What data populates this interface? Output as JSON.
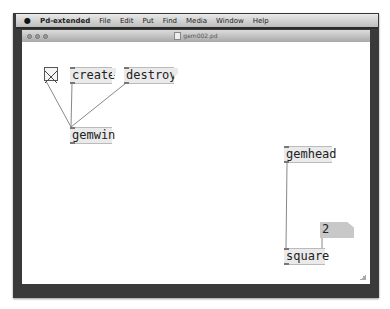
{
  "menubar": {
    "apple_icon": "apple-logo",
    "items": [
      {
        "label": "Pd-extended",
        "bold": true
      },
      {
        "label": "File"
      },
      {
        "label": "Edit"
      },
      {
        "label": "Put"
      },
      {
        "label": "Find"
      },
      {
        "label": "Media"
      },
      {
        "label": "Window"
      },
      {
        "label": "Help"
      }
    ]
  },
  "window": {
    "title": "gem002.pd",
    "traffic_lights": [
      "close",
      "minimize",
      "zoom"
    ]
  },
  "patch": {
    "toggle": {
      "state": "on"
    },
    "objects": {
      "create": "create",
      "destroy": "destroy",
      "gemwin": "gemwin",
      "gemhead": "gemhead",
      "square": "square"
    },
    "number_box": {
      "value": "2"
    }
  },
  "colors": {
    "box_fill": "#eaeaea",
    "numbox_fill": "#c8c8c8",
    "wire": "#888888",
    "frame": "#3a3a3a"
  }
}
